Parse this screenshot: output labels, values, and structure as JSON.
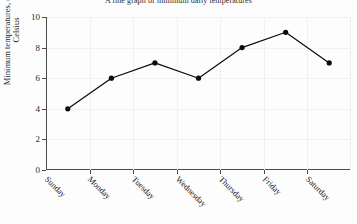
{
  "chart_data": {
    "type": "line",
    "title": "A line graph of minimum daily temperatures",
    "xlabel": "",
    "ylabel_line1": "Minimum temperatures, degrees",
    "ylabel_line2": "Celsius",
    "categories": [
      "Sunday",
      "Monday",
      "Tuesday",
      "Wednesday",
      "Thursday",
      "Friday",
      "Saturday"
    ],
    "values": [
      4,
      6,
      7,
      6,
      8,
      9,
      7
    ],
    "series": [
      {
        "name": "Minimum daily temperature",
        "values": [
          4,
          6,
          7,
          6,
          8,
          9,
          7
        ]
      }
    ],
    "ylim": [
      0,
      10
    ],
    "yticks": [
      0,
      2,
      4,
      6,
      8,
      10
    ],
    "ytick_labels": [
      "0",
      "2",
      "4",
      "6",
      "8",
      "10"
    ],
    "grid": true,
    "legend": "none",
    "marker": "filled-circle",
    "line_color": "#0b0b0b",
    "grid_color": "#f1f1f1",
    "axis_color": "#4a4a4a",
    "background_color": "#fdfdfd"
  }
}
